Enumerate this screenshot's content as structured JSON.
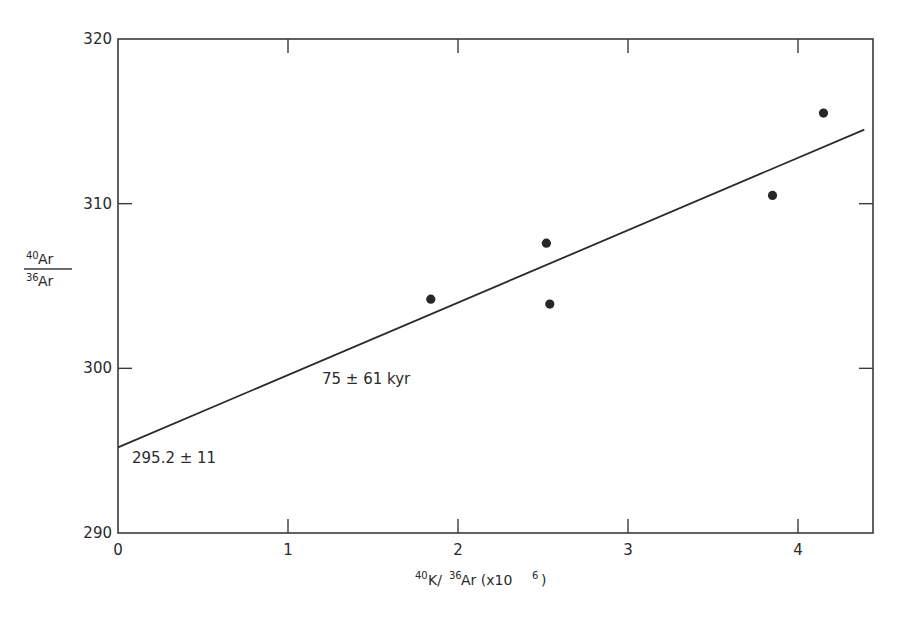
{
  "chart_data": {
    "type": "scatter",
    "title": "",
    "xlabel": "40K/36Ar (x10^6)",
    "ylabel": "40Ar/36Ar",
    "xlim": [
      0,
      4.45
    ],
    "ylim": [
      290,
      320
    ],
    "x_ticks": [
      "0",
      "1",
      "2",
      "3",
      "4"
    ],
    "y_ticks": [
      "290",
      "300",
      "310",
      "320"
    ],
    "grid": false,
    "legend": null,
    "series": [
      {
        "name": "samples",
        "type": "scatter",
        "x": [
          1.84,
          2.52,
          2.54,
          3.85,
          4.15
        ],
        "y": [
          304.2,
          307.6,
          303.9,
          310.5,
          315.5
        ]
      },
      {
        "name": "isochron fit",
        "type": "line",
        "x": [
          0,
          4.39
        ],
        "y": [
          295.2,
          314.5
        ]
      }
    ],
    "annotations": [
      {
        "text": "75 ± 61 kyr",
        "x": 1.2,
        "y": 299
      },
      {
        "text": "295.2 ± 11",
        "x": 0.1,
        "y": 294.5
      }
    ]
  },
  "labels": {
    "ylabel_num": "40",
    "ylabel_num_el": "Ar",
    "ylabel_den": "36",
    "ylabel_den_el": "Ar",
    "xlabel_sup1": "40",
    "xlabel_k": "K/",
    "xlabel_sup2": "36",
    "xlabel_ar": "Ar (x10",
    "xlabel_sup3": "6",
    "xlabel_close": ")",
    "age": "75 ± 61 kyr",
    "intercept": "295.2 ± 11"
  }
}
